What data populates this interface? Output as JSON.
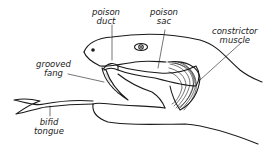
{
  "diagram": {
    "labels": {
      "poison_duct": [
        "poison",
        "duct"
      ],
      "poison_sac": [
        "poison",
        "sac"
      ],
      "constrictor_muscle": [
        "constrictor",
        "muscle"
      ],
      "grooved_fang": [
        "grooved",
        "fang"
      ],
      "bifid_tongue": [
        "bifid",
        "tongue"
      ]
    },
    "colors": {
      "ink": "#1a1a1a",
      "background": "#ffffff"
    }
  }
}
